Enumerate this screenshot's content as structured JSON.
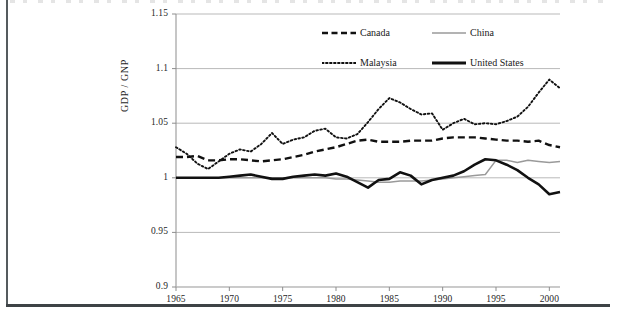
{
  "figure": {
    "y_axis_title": "GDP / GNP"
  },
  "legend": {
    "entries": [
      {
        "label": "Canada",
        "style": "dashed",
        "color": "#111111",
        "width": 2.6
      },
      {
        "label": "China",
        "style": "solid-thin",
        "color": "#9a9a9a",
        "width": 1.5
      },
      {
        "label": "Malaysia",
        "style": "dotted",
        "color": "#111111",
        "width": 1.9
      },
      {
        "label": "United States",
        "style": "solid-thick",
        "color": "#111111",
        "width": 3.0
      }
    ]
  },
  "chart_data": {
    "type": "line",
    "title": "",
    "xlabel": "",
    "ylabel": "GDP / GNP",
    "xlim": [
      1965,
      2001
    ],
    "ylim": [
      0.9,
      1.15
    ],
    "xticks": [
      1965,
      1970,
      1975,
      1980,
      1985,
      1990,
      1995,
      2000
    ],
    "yticks": [
      0.9,
      0.95,
      1,
      1.05,
      1.1,
      1.15
    ],
    "ytick_labels": [
      "0.9",
      "0.95",
      "1",
      "1.05",
      "1.1",
      "1.15"
    ],
    "xtick_labels": [
      "1965",
      "1970",
      "1975",
      "1980",
      "1985",
      "1990",
      "1995",
      "2000"
    ],
    "grid": "horizontal",
    "legend_position": "upper-center",
    "x": [
      1965,
      1966,
      1967,
      1968,
      1969,
      1970,
      1971,
      1972,
      1973,
      1974,
      1975,
      1976,
      1977,
      1978,
      1979,
      1980,
      1981,
      1982,
      1983,
      1984,
      1985,
      1986,
      1987,
      1988,
      1989,
      1990,
      1991,
      1992,
      1993,
      1994,
      1995,
      1996,
      1997,
      1998,
      1999,
      2000,
      2001
    ],
    "series": [
      {
        "name": "Canada",
        "style": "dashed",
        "color": "#111111",
        "values": [
          1.019,
          1.019,
          1.02,
          1.016,
          1.016,
          1.017,
          1.017,
          1.016,
          1.015,
          1.016,
          1.017,
          1.019,
          1.021,
          1.024,
          1.026,
          1.028,
          1.031,
          1.034,
          1.035,
          1.033,
          1.033,
          1.033,
          1.034,
          1.034,
          1.034,
          1.036,
          1.037,
          1.037,
          1.037,
          1.036,
          1.035,
          1.034,
          1.034,
          1.033,
          1.034,
          1.03,
          1.028
        ]
      },
      {
        "name": "China",
        "style": "solid-thin",
        "color": "#9a9a9a",
        "values": [
          1.0,
          1.0,
          1.0,
          1.0,
          1.0,
          1.0,
          1.0,
          1.0,
          1.0,
          1.0,
          1.0,
          1.0,
          1.0,
          1.0,
          1.0,
          0.999,
          0.999,
          0.998,
          0.997,
          0.996,
          0.996,
          0.997,
          0.997,
          0.997,
          0.998,
          0.999,
          1.0,
          1.001,
          1.002,
          1.003,
          1.016,
          1.016,
          1.014,
          1.016,
          1.015,
          1.014,
          1.015
        ]
      },
      {
        "name": "Malaysia",
        "style": "dotted",
        "color": "#111111",
        "values": [
          1.028,
          1.022,
          1.013,
          1.008,
          1.015,
          1.022,
          1.026,
          1.024,
          1.031,
          1.041,
          1.031,
          1.035,
          1.037,
          1.043,
          1.045,
          1.037,
          1.036,
          1.04,
          1.051,
          1.063,
          1.073,
          1.069,
          1.063,
          1.058,
          1.059,
          1.044,
          1.05,
          1.054,
          1.049,
          1.05,
          1.049,
          1.052,
          1.056,
          1.065,
          1.078,
          1.09,
          1.082
        ]
      },
      {
        "name": "United States",
        "style": "solid-thick",
        "color": "#111111",
        "values": [
          1.0,
          1.0,
          1.0,
          1.0,
          1.0,
          1.001,
          1.002,
          1.003,
          1.001,
          0.999,
          0.999,
          1.001,
          1.002,
          1.003,
          1.002,
          1.004,
          1.001,
          0.996,
          0.991,
          0.998,
          0.999,
          1.005,
          1.002,
          0.994,
          0.998,
          1.0,
          1.002,
          1.006,
          1.012,
          1.017,
          1.016,
          1.012,
          1.007,
          1.0,
          0.994,
          0.985,
          0.987
        ]
      }
    ]
  }
}
